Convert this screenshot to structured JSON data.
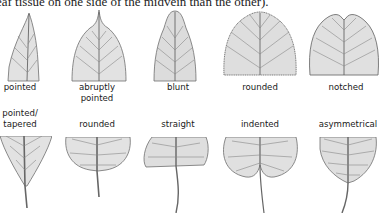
{
  "caption": "eaf tissue on one side of the midvein than the other).",
  "tips": {
    "heading": "leaf tips",
    "items": [
      {
        "label": "pointed"
      },
      {
        "label": "abruptly",
        "label2": "pointed"
      },
      {
        "label": "blunt"
      },
      {
        "label": "rounded"
      },
      {
        "label": "notched"
      }
    ]
  },
  "bases": {
    "heading": "leaf bases",
    "items": [
      {
        "label": "pointed/",
        "label2": "tapered"
      },
      {
        "label": "rounded"
      },
      {
        "label": "straight"
      },
      {
        "label": "indented"
      },
      {
        "label": "asymmetrical"
      }
    ]
  },
  "colors": {
    "ink": "#1a1a1a",
    "leaf_fill": "#e4e4e4",
    "leaf_stroke": "#6f6f6f",
    "vein": "#555555"
  }
}
